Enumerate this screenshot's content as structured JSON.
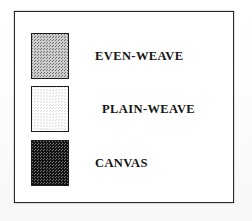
{
  "figure": {
    "kind": "legend-key",
    "frame": {
      "border_color": "#2a2a2a",
      "background_color": "#ffffff"
    },
    "page_background_color": "#fbfbfa",
    "entries": [
      {
        "label": "EVEN-WEAVE",
        "swatch_name": "swatch-even-weave",
        "pattern": "medium-gray checkerboard dither",
        "fill_color": "#6d6d6d",
        "border_color": "#1d1d1d"
      },
      {
        "label": "PLAIN-WEAVE",
        "swatch_name": "swatch-plain-weave",
        "pattern": "light checkerboard dither",
        "fill_color": "#d8d8d8",
        "border_color": "#1d1d1d"
      },
      {
        "label": "CANVAS",
        "swatch_name": "swatch-canvas",
        "pattern": "dark checkerboard dither",
        "fill_color": "#1a1a1a",
        "border_color": "#1d1d1d"
      }
    ]
  }
}
